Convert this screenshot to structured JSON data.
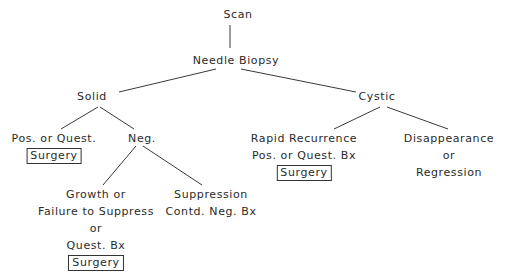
{
  "diagram": {
    "type": "decision-tree",
    "nodes": {
      "scan": {
        "label": "Scan"
      },
      "needle_biopsy": {
        "label": "Needle Biopsy"
      },
      "solid": {
        "label": "Solid"
      },
      "cystic": {
        "label": "Cystic"
      },
      "solid_pos": {
        "label": "Pos. or Quest.",
        "action": "Surgery"
      },
      "solid_neg": {
        "label": "Neg."
      },
      "growth": {
        "lines": [
          "Growth or",
          "Failure to Suppress",
          "or",
          "Quest. Bx"
        ],
        "action": "Surgery"
      },
      "suppression": {
        "lines": [
          "Suppression",
          "Contd. Neg. Bx"
        ]
      },
      "rapid_recurrence": {
        "lines": [
          "Rapid Recurrence",
          "Pos. or Quest. Bx"
        ],
        "action": "Surgery"
      },
      "disappearance": {
        "lines": [
          "Disappearance",
          "or",
          "Regression"
        ]
      }
    },
    "edges": [
      [
        "scan",
        "needle_biopsy"
      ],
      [
        "needle_biopsy",
        "solid"
      ],
      [
        "needle_biopsy",
        "cystic"
      ],
      [
        "solid",
        "solid_pos"
      ],
      [
        "solid",
        "solid_neg"
      ],
      [
        "solid_neg",
        "growth"
      ],
      [
        "solid_neg",
        "suppression"
      ],
      [
        "cystic",
        "rapid_recurrence"
      ],
      [
        "cystic",
        "disappearance"
      ]
    ]
  }
}
